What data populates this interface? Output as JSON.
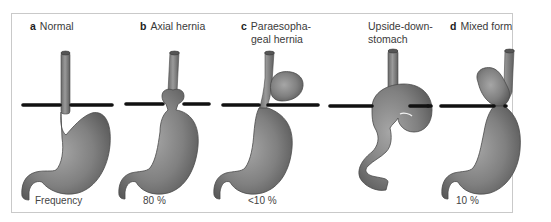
{
  "figure": {
    "panels": [
      {
        "letter": "a",
        "title": "Normal",
        "title_line2": "",
        "frequency": "Frequency"
      },
      {
        "letter": "b",
        "title": "Axial hernia",
        "title_line2": "",
        "frequency": "80 %"
      },
      {
        "letter": "c",
        "title": "Paraesopha-",
        "title_line2": "geal hernia",
        "frequency": "<10 %"
      },
      {
        "letter": "",
        "title": "Upside-down-",
        "title_line2": "stomach",
        "frequency": ""
      },
      {
        "letter": "d",
        "title": "Mixed form",
        "title_line2": "",
        "frequency": "10 %"
      }
    ],
    "colors": {
      "stomach_fill": "#7a7a7a",
      "stomach_highlight": "#a8a8a8",
      "outline": "#4a4a4a",
      "diaphragm": "#111111",
      "border": "#c9c9c9"
    }
  }
}
